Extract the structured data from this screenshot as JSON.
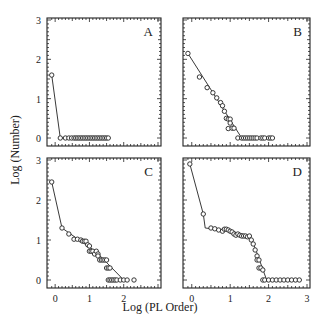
{
  "figure": {
    "xlabel": "Log (PL Order)",
    "ylabel": "Log (Number)",
    "colors": {
      "ink": "#222222",
      "background": "#ffffff"
    }
  },
  "chart_data": [
    {
      "type": "scatter",
      "panel": "A",
      "title": "A",
      "xlabel": "Log (PL Order)",
      "ylabel": "Log (Number)",
      "xlim": [
        -0.15,
        3.0
      ],
      "ylim": [
        0,
        3
      ],
      "yticks": [
        "0",
        "1",
        "2",
        "3"
      ],
      "xticks": [],
      "points": [
        [
          -0.1,
          1.6
        ],
        [
          0.15,
          0.0
        ],
        [
          0.3,
          0.0
        ],
        [
          0.4,
          0.0
        ],
        [
          0.48,
          0.0
        ],
        [
          0.55,
          0.0
        ],
        [
          0.6,
          0.0
        ],
        [
          0.65,
          0.0
        ],
        [
          0.7,
          0.0
        ],
        [
          0.75,
          0.0
        ],
        [
          0.8,
          0.0
        ],
        [
          0.85,
          0.0
        ],
        [
          0.9,
          0.0
        ],
        [
          0.95,
          0.0
        ],
        [
          1.0,
          0.0
        ],
        [
          1.05,
          0.0
        ],
        [
          1.1,
          0.0
        ],
        [
          1.15,
          0.0
        ],
        [
          1.2,
          0.0
        ],
        [
          1.25,
          0.0
        ],
        [
          1.3,
          0.0
        ],
        [
          1.35,
          0.0
        ],
        [
          1.4,
          0.0
        ],
        [
          1.45,
          0.0
        ],
        [
          1.5,
          0.0
        ],
        [
          1.55,
          0.0
        ]
      ],
      "fit_line": [
        [
          -0.1,
          1.6
        ],
        [
          0.15,
          0.0
        ],
        [
          1.55,
          0.0
        ]
      ]
    },
    {
      "type": "scatter",
      "panel": "B",
      "title": "B",
      "xlabel": "Log (PL Order)",
      "ylabel": "Log (Number)",
      "xlim": [
        -0.15,
        3.0
      ],
      "ylim": [
        0,
        3
      ],
      "yticks": [],
      "xticks": [],
      "points": [
        [
          -0.1,
          2.15
        ],
        [
          0.2,
          1.55
        ],
        [
          0.4,
          1.28
        ],
        [
          0.55,
          1.15
        ],
        [
          0.65,
          1.02
        ],
        [
          0.75,
          0.9
        ],
        [
          0.8,
          0.82
        ],
        [
          0.85,
          0.68
        ],
        [
          0.9,
          0.5
        ],
        [
          0.95,
          0.48
        ],
        [
          1.0,
          0.48
        ],
        [
          0.95,
          0.24
        ],
        [
          1.05,
          0.25
        ],
        [
          1.1,
          0.25
        ],
        [
          1.0,
          0.38
        ],
        [
          1.2,
          0.0
        ],
        [
          1.3,
          0.0
        ],
        [
          1.35,
          0.0
        ],
        [
          1.4,
          0.0
        ],
        [
          1.45,
          0.0
        ],
        [
          1.5,
          0.0
        ],
        [
          1.55,
          0.0
        ],
        [
          1.6,
          0.0
        ],
        [
          1.65,
          0.0
        ],
        [
          1.7,
          0.0
        ],
        [
          1.8,
          0.0
        ],
        [
          1.85,
          0.0
        ],
        [
          1.9,
          0.0
        ],
        [
          2.0,
          0.0
        ],
        [
          2.05,
          0.0
        ],
        [
          2.1,
          0.0
        ]
      ],
      "fit_line": [
        [
          -0.1,
          2.15
        ],
        [
          1.3,
          0.0
        ],
        [
          2.1,
          0.0
        ]
      ]
    },
    {
      "type": "scatter",
      "panel": "C",
      "title": "C",
      "xlabel": "Log (PL Order)",
      "ylabel": "Log (Number)",
      "xlim": [
        -0.15,
        3.0
      ],
      "ylim": [
        0,
        3
      ],
      "yticks": [
        "0",
        "1",
        "2",
        "3"
      ],
      "xticks": [
        "0",
        "1",
        "2"
      ],
      "points": [
        [
          -0.1,
          2.45
        ],
        [
          0.2,
          1.3
        ],
        [
          0.4,
          1.15
        ],
        [
          0.55,
          1.02
        ],
        [
          0.65,
          1.02
        ],
        [
          0.75,
          1.0
        ],
        [
          0.8,
          0.97
        ],
        [
          0.85,
          0.97
        ],
        [
          0.9,
          0.97
        ],
        [
          0.95,
          0.88
        ],
        [
          1.0,
          0.85
        ],
        [
          1.0,
          0.72
        ],
        [
          1.05,
          0.72
        ],
        [
          1.1,
          0.72
        ],
        [
          1.15,
          0.65
        ],
        [
          1.2,
          0.72
        ],
        [
          1.25,
          0.65
        ],
        [
          1.25,
          0.6
        ],
        [
          1.3,
          0.5
        ],
        [
          1.35,
          0.5
        ],
        [
          1.4,
          0.5
        ],
        [
          1.45,
          0.5
        ],
        [
          1.5,
          0.5
        ],
        [
          1.5,
          0.3
        ],
        [
          1.55,
          0.3
        ],
        [
          1.6,
          0.3
        ],
        [
          1.55,
          0.0
        ],
        [
          1.6,
          0.0
        ],
        [
          1.65,
          0.0
        ],
        [
          1.7,
          0.0
        ],
        [
          1.75,
          0.0
        ],
        [
          1.8,
          0.0
        ],
        [
          1.9,
          0.0
        ],
        [
          2.0,
          0.0
        ],
        [
          2.1,
          0.0
        ],
        [
          2.3,
          0.0
        ]
      ],
      "fit_line": [
        [
          -0.1,
          2.45
        ],
        [
          0.2,
          1.3
        ],
        [
          1.2,
          0.7
        ],
        [
          1.6,
          0.35
        ],
        [
          2.0,
          0.0
        ]
      ]
    },
    {
      "type": "scatter",
      "panel": "D",
      "title": "D",
      "xlabel": "Log (PL Order)",
      "ylabel": "Log (Number)",
      "xlim": [
        -0.15,
        3.0
      ],
      "ylim": [
        0,
        3
      ],
      "yticks": [],
      "xticks": [
        "0",
        "1",
        "2",
        "3"
      ],
      "points": [
        [
          -0.05,
          2.9
        ],
        [
          0.3,
          1.65
        ],
        [
          0.5,
          1.3
        ],
        [
          0.6,
          1.28
        ],
        [
          0.7,
          1.25
        ],
        [
          0.8,
          1.22
        ],
        [
          0.85,
          1.27
        ],
        [
          0.9,
          1.27
        ],
        [
          0.95,
          1.25
        ],
        [
          1.0,
          1.22
        ],
        [
          1.05,
          1.2
        ],
        [
          1.1,
          1.15
        ],
        [
          1.15,
          1.12
        ],
        [
          1.2,
          1.15
        ],
        [
          1.25,
          1.12
        ],
        [
          1.3,
          1.1
        ],
        [
          1.35,
          1.1
        ],
        [
          1.4,
          1.1
        ],
        [
          1.45,
          1.08
        ],
        [
          1.5,
          1.1
        ],
        [
          1.55,
          1.0
        ],
        [
          1.6,
          0.9
        ],
        [
          1.65,
          0.75
        ],
        [
          1.7,
          0.6
        ],
        [
          1.7,
          0.5
        ],
        [
          1.75,
          0.5
        ],
        [
          1.75,
          0.3
        ],
        [
          1.8,
          0.3
        ],
        [
          1.85,
          0.25
        ],
        [
          1.85,
          0.0
        ],
        [
          1.9,
          0.0
        ],
        [
          2.0,
          0.0
        ],
        [
          2.1,
          0.0
        ],
        [
          2.2,
          0.0
        ],
        [
          2.3,
          0.0
        ],
        [
          2.4,
          0.0
        ],
        [
          2.5,
          0.0
        ],
        [
          2.6,
          0.0
        ],
        [
          2.7,
          0.0
        ],
        [
          2.8,
          0.0
        ]
      ],
      "fit_line": [
        [
          -0.05,
          2.9
        ],
        [
          0.3,
          1.65
        ],
        [
          0.35,
          1.3
        ],
        [
          1.0,
          1.23
        ],
        [
          1.5,
          1.1
        ],
        [
          1.65,
          0.8
        ],
        [
          1.8,
          0.4
        ],
        [
          1.95,
          0.0
        ],
        [
          2.8,
          0.0
        ]
      ]
    }
  ]
}
